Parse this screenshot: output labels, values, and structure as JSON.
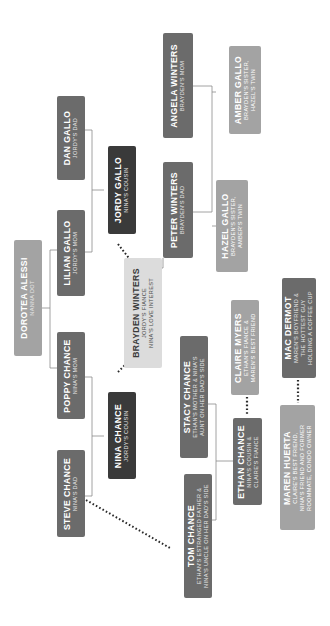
{
  "colors": {
    "dark": "#3a3a3a",
    "mid": "#6b6b6b",
    "light": "#a3a3a3",
    "pale": "#dcdcdc",
    "line": "#8a8a8a",
    "dotted": "#2a2a2a"
  },
  "people": [
    {
      "id": "dan",
      "name": "DAN GALLO",
      "role": [
        "JORDY'S DAD"
      ]
    },
    {
      "id": "lilian",
      "name": "LILIAN GALLO",
      "role": [
        "JORDY'S MOM"
      ]
    },
    {
      "id": "dorotea",
      "name": "DOROTEA ALESSI",
      "role": [
        "NANNA DOT"
      ]
    },
    {
      "id": "poppy",
      "name": "POPPY CHANCE",
      "role": [
        "NINA'S MOM"
      ]
    },
    {
      "id": "steve",
      "name": "STEVE CHANCE",
      "role": [
        "NINA'S DAD"
      ]
    },
    {
      "id": "jordy",
      "name": "JORDY GALLO",
      "role": [
        "NINA'S COUSIN"
      ]
    },
    {
      "id": "nina",
      "name": "NINA CHANCE",
      "role": [
        "JORDY'S COUSIN"
      ]
    },
    {
      "id": "brayden",
      "name": "BRAYDEN WINTERS",
      "role": [
        "JORDY'S FIANCE",
        "NINA'S LOVE INTEREST"
      ]
    },
    {
      "id": "peter",
      "name": "PETER WINTERS",
      "role": [
        "BRAYDEN'S DAD"
      ]
    },
    {
      "id": "angela",
      "name": "ANGELA WINTERS",
      "role": [
        "BRAYDEN'S MOM"
      ]
    },
    {
      "id": "hazel",
      "name": "HAZEL GALLO",
      "role": [
        "BRAYDEN'S SISTER,",
        "AMBER'S TWIN"
      ]
    },
    {
      "id": "amber",
      "name": "AMBER GALLO",
      "role": [
        "BRAYDEN'S SISTER,",
        "HAZEL'S TWIN"
      ]
    },
    {
      "id": "stacy",
      "name": "STACY CHANCE",
      "role": [
        "ETHAN'S MOTHER & NINA'S",
        "AUNT ON HER DAD'S SIDE"
      ]
    },
    {
      "id": "tom",
      "name": "TOM CHANCE",
      "role": [
        "ETHAN'S ESTRANGED FATHER &",
        "NINA'S UNCLE ON HER DAD'S SIDE"
      ]
    },
    {
      "id": "ethan",
      "name": "ETHAN CHANCE",
      "role": [
        "NINA'S COUSIN &",
        "CLAIRE'S FIANCE"
      ]
    },
    {
      "id": "claire",
      "name": "CLAIRE MYERS",
      "role": [
        "ETHAN'S FIANCE &",
        "MAREN'S BEST FRIEND"
      ]
    },
    {
      "id": "maren",
      "name": "MAREN HUERTA",
      "role": [
        "CLAIRE'S BEST FRIEND,",
        "NINA'S FRIEND AND FORMER",
        "ROOMMATE, CONDO OWNER"
      ]
    },
    {
      "id": "mac",
      "name": "MAC DERMOT",
      "role": [
        "MAREN'S BOYFRIEND &",
        "THE HOTTEST GUY",
        "HOLDING A COFFEE CUP"
      ]
    }
  ]
}
